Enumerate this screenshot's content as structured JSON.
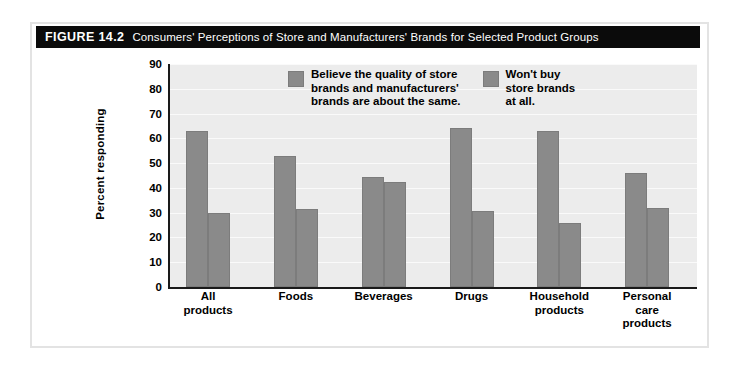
{
  "figure": {
    "label": "FIGURE 14.2",
    "caption": "Consumers' Perceptions of Store and Manufacturers' Brands for Selected Product Groups"
  },
  "legend": {
    "entries": [
      {
        "label": "Believe the quality of store\nbrands and manufacturers'\nbrands are about the same.",
        "color": "#8a8a8a"
      },
      {
        "label": "Won't buy\nstore brands\nat all.",
        "color": "#8a8a8a"
      }
    ]
  },
  "axis": {
    "y_title": "Percent responding",
    "y_ticks": [
      "0",
      "10",
      "20",
      "30",
      "40",
      "50",
      "60",
      "70",
      "80",
      "90"
    ]
  },
  "x_labels": [
    "All\nproducts",
    "Foods",
    "Beverages",
    "Drugs",
    "Household\nproducts",
    "Personal\ncare\nproducts"
  ],
  "chart_data": {
    "type": "bar",
    "title": "Consumers' Perceptions of Store and Manufacturers' Brands for Selected Product Groups",
    "xlabel": "",
    "ylabel": "Percent responding",
    "ylim": [
      0,
      90
    ],
    "ytick_step": 10,
    "grid": true,
    "legend_position": "inside-top",
    "categories": [
      "All products",
      "Foods",
      "Beverages",
      "Drugs",
      "Household products",
      "Personal care products"
    ],
    "series": [
      {
        "name": "Believe the quality of store brands and manufacturers' brands are about the same.",
        "color": "#8a8a8a",
        "values": [
          63,
          53,
          44.5,
          64,
          63,
          46
        ]
      },
      {
        "name": "Won't buy store brands at all.",
        "color": "#8a8a8a",
        "values": [
          30,
          31.5,
          42.5,
          30.5,
          26,
          32
        ]
      }
    ]
  }
}
